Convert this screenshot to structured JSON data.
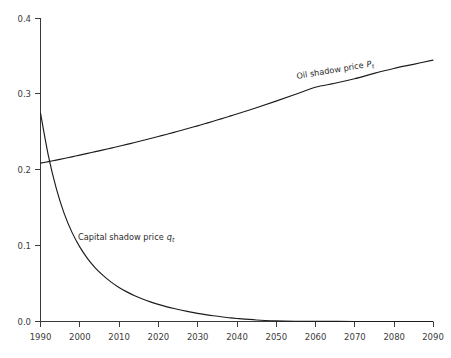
{
  "chart_data": {
    "type": "line",
    "title": "",
    "xlabel": "",
    "ylabel": "",
    "xlim": [
      1990,
      2090
    ],
    "ylim": [
      0.0,
      0.4
    ],
    "grid": false,
    "legend_position": "inline-annotations",
    "x_ticks": [
      1990,
      2000,
      2010,
      2020,
      2030,
      2040,
      2050,
      2060,
      2070,
      2080,
      2090
    ],
    "x_tick_labels": [
      "1990",
      "2000",
      "2010",
      "2020",
      "2030",
      "2040",
      "2050",
      "2060",
      "2070",
      "2080",
      "2090"
    ],
    "y_ticks": [
      0.0,
      0.1,
      0.2,
      0.3,
      0.4
    ],
    "y_tick_labels": [
      "0.0",
      "0.1",
      "0.2",
      "0.3",
      "0.4"
    ],
    "x": [
      1990,
      1992,
      1994,
      1996,
      1998,
      2000,
      2002,
      2004,
      2006,
      2008,
      2010,
      2012,
      2014,
      2016,
      2018,
      2020,
      2022,
      2024,
      2026,
      2028,
      2030,
      2032,
      2034,
      2036,
      2038,
      2040,
      2045,
      2050,
      2055,
      2060,
      2065,
      2070,
      2075,
      2080,
      2085,
      2090
    ],
    "series": [
      {
        "name": "Oil shadow price",
        "symbol": "P",
        "subscript": "t",
        "label": "Oil  shadow price",
        "color": "#1c1c1c",
        "values": [
          0.209,
          0.211,
          0.2131,
          0.2152,
          0.2174,
          0.2196,
          0.2219,
          0.2242,
          0.2265,
          0.2289,
          0.2313,
          0.2338,
          0.2363,
          0.2389,
          0.2415,
          0.2442,
          0.2469,
          0.2497,
          0.2525,
          0.2554,
          0.2583,
          0.2613,
          0.2644,
          0.2675,
          0.2707,
          0.2739,
          0.2822,
          0.2909,
          0.2999,
          0.3092,
          0.3145,
          0.3205,
          0.3275,
          0.334,
          0.3395,
          0.345
        ]
      },
      {
        "name": "Capital shadow price",
        "symbol": "q",
        "subscript": "t",
        "label": "Capital shadow price",
        "color": "#1c1c1c",
        "values": [
          0.275,
          0.219,
          0.176,
          0.143,
          0.118,
          0.0985,
          0.083,
          0.0705,
          0.0605,
          0.052,
          0.045,
          0.0391,
          0.034,
          0.0297,
          0.0259,
          0.0226,
          0.0197,
          0.0171,
          0.0148,
          0.0127,
          0.0108,
          0.0091,
          0.0076,
          0.0062,
          0.005,
          0.004,
          0.002,
          0.0009,
          0.0004,
          0.0002,
          0.0001,
          0.0,
          0.0,
          0.0,
          0.0,
          0.0
        ]
      }
    ],
    "annotations": [
      {
        "name": "oil-shadow-price-label",
        "text": "Oil  shadow price",
        "symbol": "P",
        "subscript": "t",
        "x": 2065,
        "y": 0.318,
        "rotation": -9.5
      },
      {
        "name": "capital-shadow-price-label",
        "text": "Capital shadow price",
        "symbol": "q",
        "subscript": "t",
        "x": 2012,
        "y": 0.118,
        "rotation": 0
      }
    ]
  }
}
